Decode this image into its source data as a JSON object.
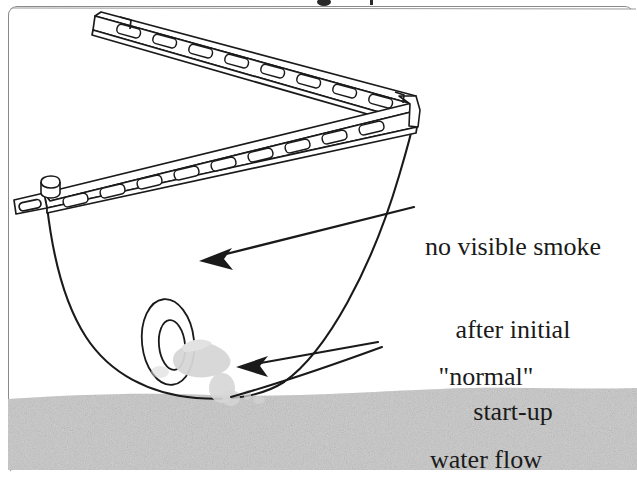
{
  "figure": {
    "type": "technical-line-drawing",
    "background_color": "#ffffff",
    "ink_color": "#1a1a1a",
    "water_band_color": "#c9c9c9",
    "splash_color": "#d8d8d8",
    "border_color": "#8a8a8a"
  },
  "annotations": {
    "smoke": {
      "lines": [
        "no visible smoke",
        "after initial",
        "start-up"
      ],
      "arrow": "barbed-arrow-pointing-left"
    },
    "flow": {
      "lines": [
        "\"normal\"",
        "water flow"
      ],
      "arrow": "barbed-arrow-pointing-left"
    }
  },
  "parts": {
    "upper_rail_label": "perforated-rail-upper",
    "lower_rail_label": "perforated-rail-lower",
    "corner_knob_label": "rail-corner-knob",
    "hull_label": "hull-outline",
    "nozzle_label": "propeller-nozzle",
    "splash_label": "water-splash",
    "waterline_label": "water-surface-band"
  }
}
